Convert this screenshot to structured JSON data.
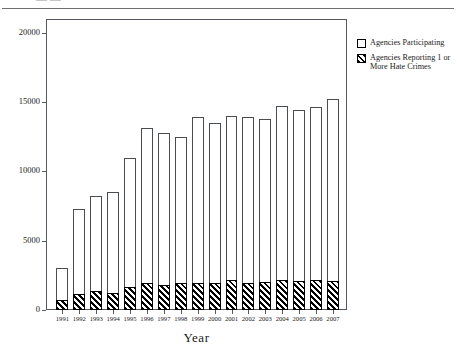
{
  "header": {
    "clipped_text": "— —",
    "rule": "horizontal-rule"
  },
  "axis": {
    "x_title": "Year",
    "y_title": ""
  },
  "legend": {
    "position": "right",
    "items": [
      {
        "label": "Agencies Participating",
        "swatch": "open-square",
        "color": "#ffffff"
      },
      {
        "label": "Agencies Reporting 1 or More Hate Crimes",
        "swatch": "hatched-square",
        "color": "#000000"
      }
    ]
  },
  "chart_data": {
    "type": "bar",
    "subtype": "overlaid-stacked",
    "title": "",
    "xlabel": "Year",
    "ylabel": "",
    "ylim": [
      0,
      21000
    ],
    "yticks": [
      0,
      5000,
      10000,
      15000,
      20000
    ],
    "ytick_labels": [
      "0",
      "5000",
      "10000",
      "15000",
      "20000"
    ],
    "grid": false,
    "legend_position": "right",
    "categories": [
      "1991",
      "1992",
      "1993",
      "1994",
      "1995",
      "1996",
      "1997",
      "1998",
      "1999",
      "2000",
      "2001",
      "2002",
      "2003",
      "2004",
      "2005",
      "2006",
      "2007"
    ],
    "series": [
      {
        "name": "Agencies Participating",
        "values": [
          3000,
          7300,
          8200,
          8500,
          11000,
          13100,
          12800,
          12500,
          13900,
          13500,
          14000,
          13900,
          13800,
          14700,
          14400,
          14650,
          15200
        ]
      },
      {
        "name": "Agencies Reporting 1 or More Hate Crimes",
        "values": [
          750,
          1150,
          1400,
          1200,
          1650,
          1950,
          1800,
          1950,
          1950,
          1950,
          2200,
          1950,
          2000,
          2150,
          2100,
          2150,
          2100
        ]
      }
    ]
  }
}
